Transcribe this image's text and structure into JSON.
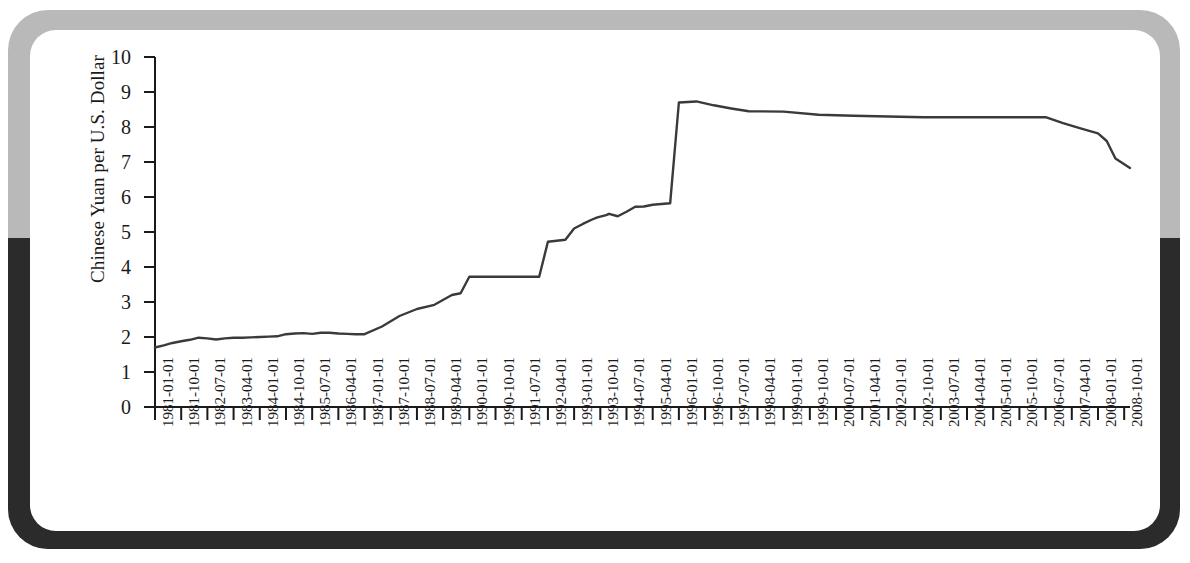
{
  "figure": {
    "frame_top_color": "#b9b9b9",
    "frame_bottom_color": "#2b2b2b",
    "card_color": "#ffffff",
    "line_color": "#3a3a3a",
    "axis_color": "#1a1a1a"
  },
  "chart_data": {
    "type": "line",
    "title": "",
    "xlabel": "",
    "ylabel": "Chinese Yuan per U.S. Dollar",
    "ylim": [
      0,
      10
    ],
    "ytick_labels": [
      "0",
      "1",
      "2",
      "3",
      "4",
      "5",
      "6",
      "7",
      "8",
      "9",
      "10"
    ],
    "yticks": [
      0,
      1,
      2,
      3,
      4,
      5,
      6,
      7,
      8,
      9,
      10
    ],
    "grid": false,
    "legend": null,
    "xtick_labels": [
      "1981-01-01",
      "1981-10-01",
      "1982-07-01",
      "1983-04-01",
      "1984-01-01",
      "1984-10-01",
      "1985-07-01",
      "1986-04-01",
      "1987-01-01",
      "1987-10-01",
      "1988-07-01",
      "1989-04-01",
      "1990-01-01",
      "1990-10-01",
      "1991-07-01",
      "1992-04-01",
      "1993-01-01",
      "1993-10-01",
      "1994-07-01",
      "1995-04-01",
      "1996-01-01",
      "1996-10-01",
      "1997-07-01",
      "1998-04-01",
      "1999-01-01",
      "1999-10-01",
      "2000-07-01",
      "2001-04-01",
      "2002-01-01",
      "2002-10-01",
      "2003-07-01",
      "2004-04-01",
      "2005-01-01",
      "2005-10-01",
      "2006-07-01",
      "2007-04-01",
      "2008-01-01",
      "2008-10-01"
    ],
    "x_start": "1981-01-01",
    "x_end": "2008-12-01",
    "x_interval_months": 9,
    "series": [
      {
        "name": "Chinese Yuan per U.S. Dollar",
        "x": [
          "1981-01",
          "1981-04",
          "1981-07",
          "1981-10",
          "1982-01",
          "1982-04",
          "1982-07",
          "1982-10",
          "1983-01",
          "1983-04",
          "1983-07",
          "1983-10",
          "1984-01",
          "1984-04",
          "1984-07",
          "1984-10",
          "1985-01",
          "1985-04",
          "1985-07",
          "1985-10",
          "1986-01",
          "1986-04",
          "1986-07",
          "1986-10",
          "1987-01",
          "1987-07",
          "1988-01",
          "1988-07",
          "1989-01",
          "1989-07",
          "1989-10",
          "1990-01",
          "1990-04",
          "1990-07",
          "1990-10",
          "1991-01",
          "1991-04",
          "1991-07",
          "1991-10",
          "1992-01",
          "1992-04",
          "1992-07",
          "1992-10",
          "1993-01",
          "1993-04",
          "1993-07",
          "1993-09",
          "1993-12",
          "1994-01",
          "1994-04",
          "1994-07",
          "1994-10",
          "1995-01",
          "1995-04",
          "1995-07",
          "1995-10",
          "1996-01",
          "1996-07",
          "1997-01",
          "1997-07",
          "1998-01",
          "1999-01",
          "2000-01",
          "2001-01",
          "2002-01",
          "2003-01",
          "2004-01",
          "2005-01",
          "2005-07",
          "2005-10",
          "2006-01",
          "2006-07",
          "2007-01",
          "2007-07",
          "2008-01",
          "2008-04",
          "2008-07",
          "2008-12"
        ],
        "y": [
          1.7,
          1.76,
          1.83,
          1.88,
          1.92,
          1.98,
          1.96,
          1.93,
          1.96,
          1.98,
          1.98,
          1.99,
          2.0,
          2.01,
          2.02,
          2.08,
          2.1,
          2.11,
          2.09,
          2.12,
          2.12,
          2.1,
          2.09,
          2.08,
          2.08,
          2.3,
          2.6,
          2.8,
          2.92,
          3.2,
          3.25,
          3.72,
          3.72,
          3.72,
          3.72,
          3.72,
          3.72,
          3.72,
          3.72,
          3.72,
          4.72,
          4.75,
          4.78,
          5.1,
          5.23,
          5.35,
          5.42,
          5.48,
          5.52,
          5.45,
          5.58,
          5.72,
          5.73,
          5.78,
          5.8,
          5.82,
          8.7,
          8.73,
          8.62,
          8.53,
          8.45,
          8.44,
          8.35,
          8.32,
          8.3,
          8.28,
          8.28,
          8.28,
          8.28,
          8.28,
          8.28,
          8.28,
          8.11,
          7.96,
          7.82,
          7.6,
          7.1,
          6.83
        ]
      }
    ],
    "annotations": [
      {
        "label": "1981 start value",
        "value": 1.7
      },
      {
        "label": "1990 devaluation plateau",
        "value": 3.72
      },
      {
        "label": "1991 devaluation plateau",
        "value": 4.72
      },
      {
        "label": "1994 unification peak",
        "value": 8.7
      },
      {
        "label": "1997-2005 peg",
        "value": 8.28
      },
      {
        "label": "2008 end value",
        "value": 6.83
      }
    ]
  }
}
